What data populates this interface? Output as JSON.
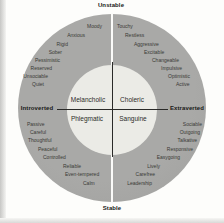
{
  "diagram": {
    "type": "temperament-wheel",
    "axes": {
      "top": "Unstable",
      "bottom": "Stable",
      "left": "Introverted",
      "right": "Extraverted"
    },
    "quadrants": [
      {
        "temperament": "Melancholic",
        "position": "upper-left",
        "traits": [
          "Moody",
          "Anxious",
          "Rigid",
          "Sober",
          "Pessimistic",
          "Reserved",
          "Unsociable",
          "Quiet"
        ]
      },
      {
        "temperament": "Choleric",
        "position": "upper-right",
        "traits": [
          "Touchy",
          "Restless",
          "Aggressive",
          "Excitable",
          "Changeable",
          "Impulsive",
          "Optimistic",
          "Active"
        ]
      },
      {
        "temperament": "Phlegmatic",
        "position": "lower-left",
        "traits": [
          "Passive",
          "Careful",
          "Thoughtful",
          "Peaceful",
          "Controlled",
          "Reliable",
          "Even-tempered",
          "Calm"
        ]
      },
      {
        "temperament": "Sanguine",
        "position": "lower-right",
        "traits": [
          "Sociable",
          "Outgoing",
          "Talkative",
          "Responsive",
          "Easygoing",
          "Lively",
          "Carefree",
          "Leadership"
        ]
      }
    ],
    "colors": {
      "ring": "#a9a9a7",
      "inner_circle": "#ebebe6",
      "divider": "#2a2a28",
      "trait_text": "#3a3a36",
      "background": "#fdfdfb"
    }
  }
}
